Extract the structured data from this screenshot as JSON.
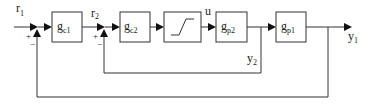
{
  "diagram": {
    "type": "cascade-control-block-diagram",
    "signals": {
      "r1": {
        "main": "r",
        "sub": "1"
      },
      "r2": {
        "main": "r",
        "sub": "2"
      },
      "u": {
        "main": "u"
      },
      "y1": {
        "main": "y",
        "sub": "1"
      },
      "y2": {
        "main": "y",
        "sub": "2"
      }
    },
    "blocks": [
      {
        "id": "gc1",
        "main": "g",
        "sub": "c1"
      },
      {
        "id": "gc2",
        "main": "g",
        "sub": "c2"
      },
      {
        "id": "sat",
        "main": "",
        "sub": "",
        "kind": "saturation"
      },
      {
        "id": "gp2",
        "main": "g",
        "sub": "p2"
      },
      {
        "id": "gp1",
        "main": "g",
        "sub": "p1"
      }
    ],
    "junctions": [
      {
        "id": "sum1",
        "plus": "+",
        "minus": "−"
      },
      {
        "id": "sum2",
        "plus": "+",
        "minus": "−"
      }
    ],
    "connections": [
      [
        "r1",
        "sum1"
      ],
      [
        "sum1",
        "gc1"
      ],
      [
        "gc1",
        "sum2"
      ],
      [
        "r2",
        "sum2"
      ],
      [
        "sum2",
        "gc2"
      ],
      [
        "gc2",
        "sat"
      ],
      [
        "sat",
        "gp2"
      ],
      [
        "gp2",
        "gp1"
      ],
      [
        "gp1",
        "y1"
      ],
      [
        "y2",
        "sum2"
      ],
      [
        "y1",
        "sum1"
      ]
    ]
  }
}
